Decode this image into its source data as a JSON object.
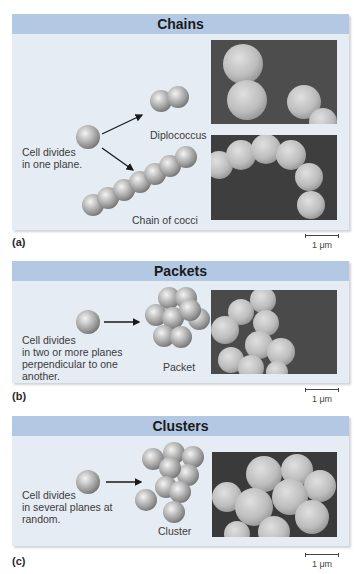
{
  "figure": {
    "panels": [
      {
        "id": "a",
        "title": "Chains",
        "description": "Cell divides in one plane.",
        "description_lines": [
          "Cell divides",
          "in one plane."
        ],
        "arrangements": [
          "Diplococcus",
          "Chain of cocci"
        ],
        "part_label": "(a)",
        "scale_label": "1 μm"
      },
      {
        "id": "b",
        "title": "Packets",
        "description_lines": [
          "Cell divides",
          "in two or more planes",
          "perpendicular to one",
          "another."
        ],
        "arrangements": [
          "Packet"
        ],
        "part_label": "(b)",
        "scale_label": "1 μm"
      },
      {
        "id": "c",
        "title": "Clusters",
        "description_lines": [
          "Cell divides",
          "in several planes at",
          "random."
        ],
        "arrangements": [
          "Cluster"
        ],
        "part_label": "(c)",
        "scale_label": "1 μm"
      }
    ],
    "colors": {
      "header": "#b3c8e2",
      "panel_bg": "#e6ecf4",
      "photo_bg": "#4a4a4a",
      "sphere": "#a8a8a8"
    }
  }
}
